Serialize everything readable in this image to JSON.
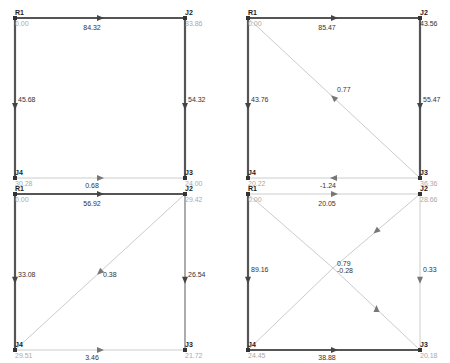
{
  "colors": {
    "heavy": "#555555",
    "medium": "#888888",
    "light": "#cccccc",
    "node": "#333333",
    "text_dark": "#333333",
    "text_light": "#aaaaaa"
  },
  "panels": [
    {
      "id": "panel-1",
      "nodes": {
        "R1": {
          "x": 15,
          "y": 18,
          "value": "0.00",
          "light": true
        },
        "J2": {
          "x": 185,
          "y": 18,
          "value": "33.86",
          "light": true
        },
        "J3": {
          "x": 185,
          "y": 178,
          "value": "24.00",
          "light": true
        },
        "J4": {
          "x": 15,
          "y": 178,
          "value": "30.28",
          "light": true
        }
      },
      "edges": [
        {
          "from": "R1",
          "to": "J2",
          "flow": "84.32",
          "weight": "heavy",
          "arrow": "right",
          "lx": 92,
          "ly": 30
        },
        {
          "from": "R1",
          "to": "J4",
          "flow": "45.68",
          "weight": "heavy",
          "arrow": "down",
          "lx": 18,
          "ly": 102
        },
        {
          "from": "J2",
          "to": "J3",
          "flow": "54.32",
          "weight": "heavy",
          "arrow": "down",
          "lx": 188,
          "ly": 102
        },
        {
          "from": "J4",
          "to": "J3",
          "flow": "0.68",
          "weight": "light",
          "arrow": "right",
          "lx": 92,
          "ly": 188
        }
      ]
    },
    {
      "id": "panel-2",
      "nodes": {
        "R1": {
          "x": 248,
          "y": 18,
          "value": "0.00",
          "light": true
        },
        "J2": {
          "x": 420,
          "y": 18,
          "value": "43.56",
          "light": false
        },
        "J3": {
          "x": 420,
          "y": 178,
          "value": "36.36",
          "light": true
        },
        "J4": {
          "x": 248,
          "y": 178,
          "value": "20.22",
          "light": true
        }
      },
      "edges": [
        {
          "from": "R1",
          "to": "J2",
          "flow": "85.47",
          "weight": "heavy",
          "arrow": "right",
          "lx": 327,
          "ly": 30
        },
        {
          "from": "R1",
          "to": "J4",
          "flow": "43.76",
          "weight": "heavy",
          "arrow": "down",
          "lx": 251,
          "ly": 102
        },
        {
          "from": "J2",
          "to": "J3",
          "flow": "55.47",
          "weight": "heavy",
          "arrow": "down",
          "lx": 423,
          "ly": 102
        },
        {
          "from": "J3",
          "to": "J4",
          "flow": "-1.24",
          "weight": "light",
          "arrow": "left",
          "lx": 328,
          "ly": 188
        },
        {
          "from": "J3",
          "to": "R1",
          "flow": "0.77",
          "weight": "light",
          "arrow": "upleft",
          "lx": 337,
          "ly": 92
        }
      ]
    },
    {
      "id": "panel-3",
      "nodes": {
        "R1": {
          "x": 15,
          "y": 194,
          "value": "0.00",
          "light": true
        },
        "J2": {
          "x": 185,
          "y": 194,
          "value": "29.42",
          "light": true
        },
        "J3": {
          "x": 185,
          "y": 350,
          "value": "21.72",
          "light": true
        },
        "J4": {
          "x": 15,
          "y": 350,
          "value": "29.51",
          "light": true
        }
      },
      "edges": [
        {
          "from": "R1",
          "to": "J2",
          "flow": "56.92",
          "weight": "heavy",
          "arrow": "right",
          "lx": 92,
          "ly": 206
        },
        {
          "from": "R1",
          "to": "J4",
          "flow": "33.08",
          "weight": "heavy",
          "arrow": "down",
          "lx": 18,
          "ly": 277
        },
        {
          "from": "J2",
          "to": "J3",
          "flow": "26.54",
          "weight": "medium",
          "arrow": "down",
          "lx": 188,
          "ly": 277
        },
        {
          "from": "J4",
          "to": "J3",
          "flow": "3.46",
          "weight": "light",
          "arrow": "right",
          "lx": 92,
          "ly": 360
        },
        {
          "from": "J2",
          "to": "J4",
          "flow": "0.38",
          "weight": "light",
          "arrow": "downleft",
          "lx": 103,
          "ly": 277
        }
      ]
    },
    {
      "id": "panel-4",
      "nodes": {
        "R1": {
          "x": 248,
          "y": 194,
          "value": "0.00",
          "light": true
        },
        "J2": {
          "x": 420,
          "y": 194,
          "value": "28.66",
          "light": true
        },
        "J3": {
          "x": 420,
          "y": 350,
          "value": "20.18",
          "light": true
        },
        "J4": {
          "x": 248,
          "y": 350,
          "value": "24.45",
          "light": true
        },
        "C": {
          "x": 333,
          "y": 268,
          "value": "",
          "light": true,
          "hidden": true
        }
      },
      "edges": [
        {
          "from": "R1",
          "to": "J2",
          "flow": "20.05",
          "weight": "light",
          "arrow": "right",
          "lx": 327,
          "ly": 206
        },
        {
          "from": "R1",
          "to": "J4",
          "flow": "89.16",
          "weight": "heavy",
          "arrow": "down",
          "lx": 251,
          "ly": 272
        },
        {
          "from": "J2",
          "to": "J3",
          "flow": "0.33",
          "weight": "light",
          "arrow": "down",
          "lx": 423,
          "ly": 272
        },
        {
          "from": "J4",
          "to": "J3",
          "flow": "38.88",
          "weight": "heavy",
          "arrow": "right",
          "lx": 327,
          "ly": 360
        },
        {
          "from": "R1",
          "to": "C",
          "flow": "",
          "weight": "light",
          "arrow": "none",
          "lx": 0,
          "ly": 0
        },
        {
          "from": "J2",
          "to": "C",
          "flow": "0.79",
          "weight": "light",
          "arrow": "downleft",
          "lx": 337,
          "ly": 266
        },
        {
          "from": "C",
          "to": "J4",
          "flow": "",
          "weight": "light",
          "arrow": "none",
          "lx": 0,
          "ly": 0
        },
        {
          "from": "C",
          "to": "J3",
          "flow": "-0.28",
          "weight": "light",
          "arrow": "up",
          "lx": 337,
          "ly": 273
        }
      ]
    }
  ]
}
